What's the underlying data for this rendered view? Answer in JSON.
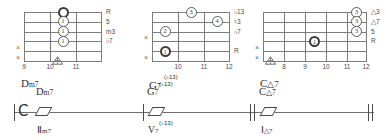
{
  "diagrams": [
    {
      "name": "Dm7",
      "chord_root": "D",
      "chord_quality": "m7",
      "superscript": "",
      "frets": [
        "9",
        "10",
        "11"
      ],
      "fret_count": 3,
      "string_count": 6,
      "intervals": [
        "R",
        "5",
        "m3",
        "♭7"
      ],
      "muted_strings": [
        "×",
        "×"
      ],
      "dots": [
        {
          "label": "",
          "string": 1,
          "fret_pos": 1,
          "thick": true
        },
        {
          "label": "1",
          "string": 2,
          "fret_pos": 1,
          "thick": false
        },
        {
          "label": "1",
          "string": 3,
          "fret_pos": 1,
          "thick": false
        },
        {
          "label": "1",
          "string": 4,
          "fret_pos": 1,
          "thick": false
        }
      ],
      "position_marker": true
    },
    {
      "name": "G7",
      "chord_root": "G",
      "chord_quality": "7",
      "superscript": "(♭13)",
      "frets": [
        "10",
        "11",
        "12"
      ],
      "fret_count": 3,
      "string_count": 6,
      "intervals": [
        "♭13",
        "♮3",
        "♭7",
        "R"
      ],
      "muted_strings": [
        "×",
        "×"
      ],
      "dots": [
        {
          "label": "3",
          "string": 1,
          "fret_pos": 2,
          "thick": false
        },
        {
          "label": "4",
          "string": 2,
          "fret_pos": 3,
          "thick": false
        },
        {
          "label": "2",
          "string": 3,
          "fret_pos": 1,
          "thick": false
        },
        {
          "label": "1",
          "string": 5,
          "fret_pos": 1,
          "thick": true
        }
      ],
      "position_marker": false
    },
    {
      "name": "C△7",
      "chord_root": "C",
      "chord_quality": "△7",
      "superscript": "",
      "frets": [
        "8",
        "9",
        "10",
        "11",
        "12"
      ],
      "fret_count": 5,
      "string_count": 6,
      "intervals": [
        "△3",
        "△7",
        "5",
        "R"
      ],
      "muted_strings": [
        "×",
        "×"
      ],
      "dots": [
        {
          "label": "3",
          "string": 1,
          "fret_pos": 5,
          "thick": false
        },
        {
          "label": "3",
          "string": 2,
          "fret_pos": 5,
          "thick": false
        },
        {
          "label": "3",
          "string": 3,
          "fret_pos": 5,
          "thick": false
        },
        {
          "label": "1",
          "string": 4,
          "fret_pos": 2,
          "thick": true
        }
      ],
      "position_marker": true
    }
  ],
  "staff": {
    "clef": "𝄌",
    "measures": [
      {
        "chord_symbol_root": "D",
        "chord_symbol_quality": "m7",
        "chord_superscript": "",
        "roman_numeral": "Ⅱ",
        "roman_quality": "m7",
        "roman_superscript": "",
        "slashes": 1
      },
      {
        "chord_symbol_root": "G",
        "chord_symbol_quality": "7",
        "chord_superscript": "(♭13)",
        "roman_numeral": "V",
        "roman_quality": "7",
        "roman_superscript": "(♭13)",
        "slashes": 1
      },
      {
        "chord_symbol_root": "C",
        "chord_symbol_quality": "△7",
        "chord_superscript": "",
        "roman_numeral": "Ⅰ",
        "roman_quality": "△7",
        "roman_superscript": "",
        "slashes": 1
      }
    ]
  },
  "colors": {
    "ink": "#3a3a3a",
    "grid": "#7c7c7c",
    "background": "#ffffff"
  }
}
